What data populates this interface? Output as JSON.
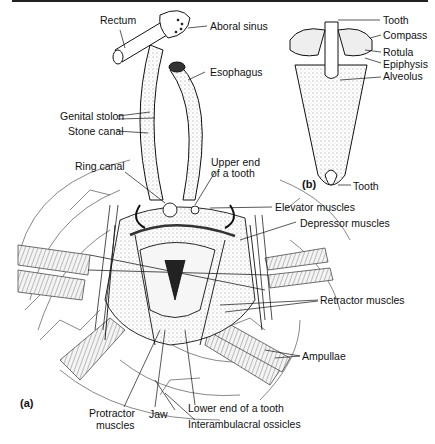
{
  "figure": {
    "panel_a_label": "(a)",
    "panel_b_label": "(b)"
  },
  "labels_a": {
    "rectum": "Rectum",
    "aboral_sinus": "Aboral sinus",
    "esophagus": "Esophagus",
    "genital_stolon": "Genital stolon",
    "stone_canal": "Stone canal",
    "ring_canal": "Ring canal",
    "upper_end_tooth_1": "Upper end",
    "upper_end_tooth_2": "of a tooth",
    "elevator_muscles": "Elevator muscles",
    "depressor_muscles": "Depressor muscles",
    "retractor_muscles": "Retractor muscles",
    "ampullae": "Ampullae",
    "protractor_muscles_1": "Protractor",
    "protractor_muscles_2": "muscles",
    "jaw": "Jaw",
    "lower_end_tooth": "Lower end of a tooth",
    "interambulacral_ossicles": "Interambulacral ossicles"
  },
  "labels_b": {
    "tooth_top": "Tooth",
    "compass": "Compass",
    "rotula": "Rotula",
    "epiphysis": "Epiphysis",
    "alveolus": "Alveolus",
    "tooth_bottom": "Tooth"
  },
  "colors": {
    "ink": "#111111",
    "stipple": "#cfcfcf"
  }
}
